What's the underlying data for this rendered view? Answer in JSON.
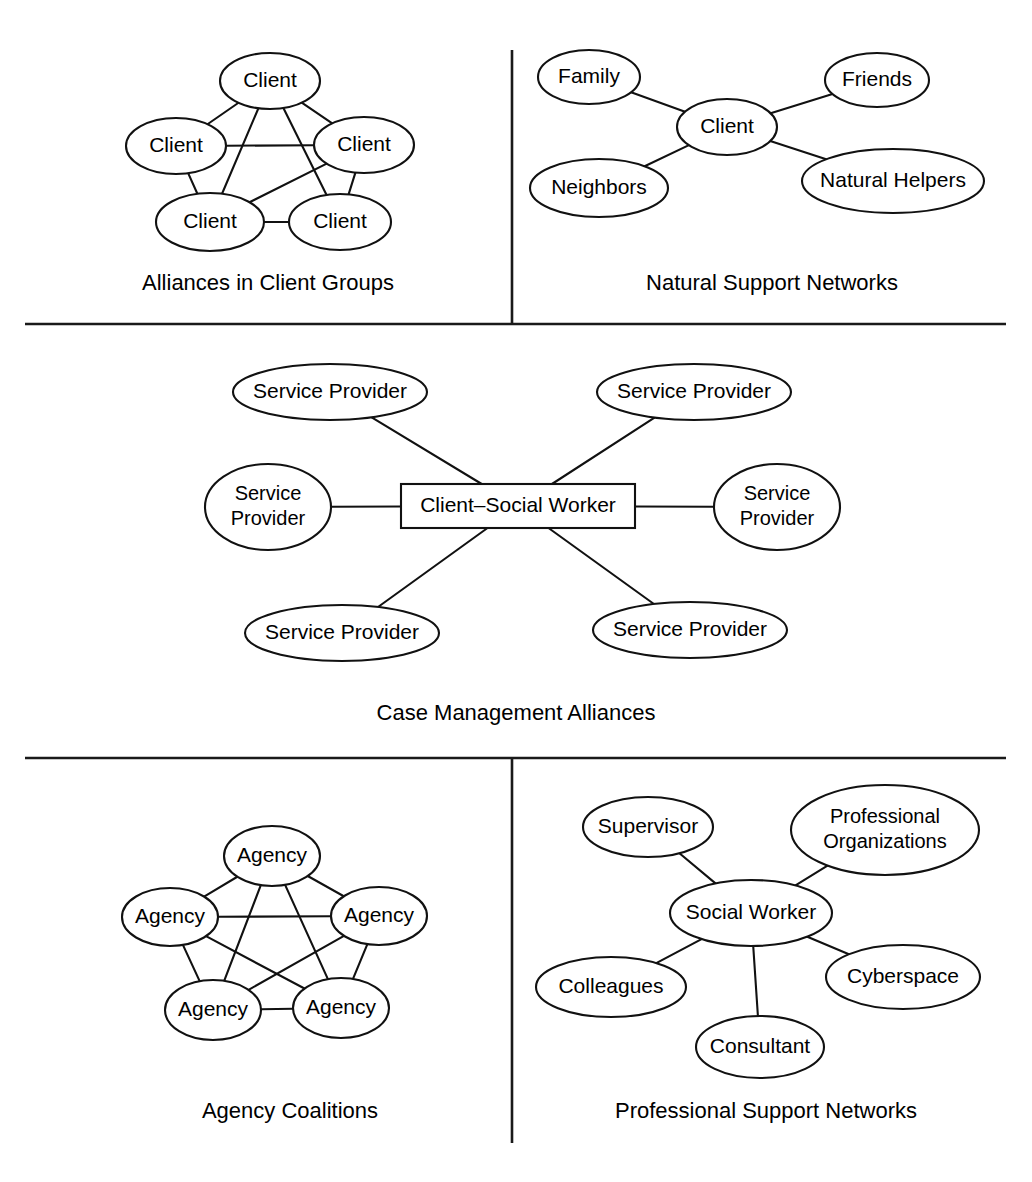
{
  "figure": {
    "background_color": "#ffffff",
    "line_color": "#111111",
    "text_color": "#000000"
  },
  "dividers": [
    {
      "name": "vertical-divider-top",
      "x1": 512,
      "y1": 50,
      "x2": 512,
      "y2": 324
    },
    {
      "name": "horizontal-divider-upper",
      "x1": 25,
      "y1": 324,
      "x2": 1006,
      "y2": 324
    },
    {
      "name": "horizontal-divider-lower",
      "x1": 25,
      "y1": 758,
      "x2": 1006,
      "y2": 758
    },
    {
      "name": "vertical-divider-bottom",
      "x1": 512,
      "y1": 758,
      "x2": 512,
      "y2": 1143
    }
  ],
  "panels": [
    {
      "id": "alliances-in-client-groups",
      "caption": "Alliances in Client Groups",
      "caption_x": 268,
      "caption_y": 284,
      "graph_type": "near-complete-graph",
      "nodes": [
        {
          "id": "c-top",
          "label": "Client",
          "cx": 270,
          "cy": 81,
          "rx": 50,
          "ry": 28,
          "shape": "ellipse"
        },
        {
          "id": "c-left",
          "label": "Client",
          "cx": 176,
          "cy": 146,
          "rx": 50,
          "ry": 28,
          "shape": "ellipse"
        },
        {
          "id": "c-right",
          "label": "Client",
          "cx": 364,
          "cy": 145,
          "rx": 50,
          "ry": 28,
          "shape": "ellipse"
        },
        {
          "id": "c-bleft",
          "label": "Client",
          "cx": 210,
          "cy": 222,
          "rx": 54,
          "ry": 29,
          "shape": "ellipse"
        },
        {
          "id": "c-bright",
          "label": "Client",
          "cx": 340,
          "cy": 222,
          "rx": 51,
          "ry": 28,
          "shape": "ellipse"
        }
      ],
      "edges": [
        [
          "c-top",
          "c-left"
        ],
        [
          "c-top",
          "c-right"
        ],
        [
          "c-top",
          "c-bleft"
        ],
        [
          "c-top",
          "c-bright"
        ],
        [
          "c-left",
          "c-right"
        ],
        [
          "c-left",
          "c-bleft"
        ],
        [
          "c-right",
          "c-bleft"
        ],
        [
          "c-right",
          "c-bright"
        ],
        [
          "c-bleft",
          "c-bright"
        ]
      ]
    },
    {
      "id": "natural-support-networks",
      "caption": "Natural Support Networks",
      "caption_x": 772,
      "caption_y": 284,
      "graph_type": "star",
      "nodes": [
        {
          "id": "n-client",
          "label": "Client",
          "cx": 727,
          "cy": 127,
          "rx": 50,
          "ry": 28,
          "shape": "ellipse"
        },
        {
          "id": "n-family",
          "label": "Family",
          "cx": 589,
          "cy": 77,
          "rx": 51,
          "ry": 27,
          "shape": "ellipse"
        },
        {
          "id": "n-friends",
          "label": "Friends",
          "cx": 877,
          "cy": 80,
          "rx": 52,
          "ry": 27,
          "shape": "ellipse"
        },
        {
          "id": "n-neighbors",
          "label": "Neighbors",
          "cx": 599,
          "cy": 188,
          "rx": 69,
          "ry": 29,
          "shape": "ellipse"
        },
        {
          "id": "n-helpers",
          "label": "Natural Helpers",
          "cx": 893,
          "cy": 181,
          "rx": 91,
          "ry": 32,
          "shape": "ellipse"
        }
      ],
      "edges": [
        [
          "n-client",
          "n-family"
        ],
        [
          "n-client",
          "n-friends"
        ],
        [
          "n-client",
          "n-neighbors"
        ],
        [
          "n-client",
          "n-helpers"
        ]
      ]
    },
    {
      "id": "case-management-alliances",
      "caption": "Case Management Alliances",
      "caption_x": 516,
      "caption_y": 714,
      "graph_type": "hub-and-spoke",
      "nodes": [
        {
          "id": "cm-hub",
          "label": "Client–Social Worker",
          "cx": 518,
          "cy": 506,
          "rx": 117,
          "ry": 22,
          "shape": "rect"
        },
        {
          "id": "cm-tl",
          "label": "Service Provider",
          "cx": 330,
          "cy": 392,
          "rx": 97,
          "ry": 28,
          "shape": "ellipse"
        },
        {
          "id": "cm-tr",
          "label": "Service Provider",
          "cx": 694,
          "cy": 392,
          "rx": 97,
          "ry": 28,
          "shape": "ellipse"
        },
        {
          "id": "cm-l",
          "label": "Service\nProvider",
          "cx": 268,
          "cy": 507,
          "rx": 63,
          "ry": 43,
          "shape": "ellipse"
        },
        {
          "id": "cm-r",
          "label": "Service\nProvider",
          "cx": 777,
          "cy": 507,
          "rx": 63,
          "ry": 43,
          "shape": "ellipse"
        },
        {
          "id": "cm-bl",
          "label": "Service Provider",
          "cx": 342,
          "cy": 633,
          "rx": 97,
          "ry": 28,
          "shape": "ellipse"
        },
        {
          "id": "cm-br",
          "label": "Service Provider",
          "cx": 690,
          "cy": 630,
          "rx": 97,
          "ry": 28,
          "shape": "ellipse"
        }
      ],
      "edges": [
        [
          "cm-hub",
          "cm-tl"
        ],
        [
          "cm-hub",
          "cm-tr"
        ],
        [
          "cm-hub",
          "cm-l"
        ],
        [
          "cm-hub",
          "cm-r"
        ],
        [
          "cm-hub",
          "cm-bl"
        ],
        [
          "cm-hub",
          "cm-br"
        ]
      ]
    },
    {
      "id": "agency-coalitions",
      "caption": "Agency Coalitions",
      "caption_x": 290,
      "caption_y": 1112,
      "graph_type": "complete-graph",
      "nodes": [
        {
          "id": "a-top",
          "label": "Agency",
          "cx": 272,
          "cy": 856,
          "rx": 48,
          "ry": 30,
          "shape": "ellipse"
        },
        {
          "id": "a-left",
          "label": "Agency",
          "cx": 170,
          "cy": 917,
          "rx": 48,
          "ry": 29,
          "shape": "ellipse"
        },
        {
          "id": "a-right",
          "label": "Agency",
          "cx": 379,
          "cy": 916,
          "rx": 48,
          "ry": 29,
          "shape": "ellipse"
        },
        {
          "id": "a-bleft",
          "label": "Agency",
          "cx": 213,
          "cy": 1010,
          "rx": 48,
          "ry": 30,
          "shape": "ellipse"
        },
        {
          "id": "a-bright",
          "label": "Agency",
          "cx": 341,
          "cy": 1008,
          "rx": 48,
          "ry": 30,
          "shape": "ellipse"
        }
      ],
      "edges": [
        [
          "a-top",
          "a-left"
        ],
        [
          "a-top",
          "a-right"
        ],
        [
          "a-top",
          "a-bleft"
        ],
        [
          "a-top",
          "a-bright"
        ],
        [
          "a-left",
          "a-right"
        ],
        [
          "a-left",
          "a-bleft"
        ],
        [
          "a-left",
          "a-bright"
        ],
        [
          "a-right",
          "a-bleft"
        ],
        [
          "a-right",
          "a-bright"
        ],
        [
          "a-bleft",
          "a-bright"
        ]
      ]
    },
    {
      "id": "professional-support-networks",
      "caption": "Professional Support Networks",
      "caption_x": 766,
      "caption_y": 1112,
      "graph_type": "star",
      "nodes": [
        {
          "id": "p-sw",
          "label": "Social Worker",
          "cx": 751,
          "cy": 913,
          "rx": 81,
          "ry": 33,
          "shape": "ellipse"
        },
        {
          "id": "p-super",
          "label": "Supervisor",
          "cx": 648,
          "cy": 827,
          "rx": 65,
          "ry": 30,
          "shape": "ellipse"
        },
        {
          "id": "p-orgs",
          "label": "Professional\nOrganizations",
          "cx": 885,
          "cy": 830,
          "rx": 94,
          "ry": 45,
          "shape": "ellipse"
        },
        {
          "id": "p-coll",
          "label": "Colleagues",
          "cx": 611,
          "cy": 987,
          "rx": 75,
          "ry": 30,
          "shape": "ellipse"
        },
        {
          "id": "p-cons",
          "label": "Consultant",
          "cx": 760,
          "cy": 1047,
          "rx": 64,
          "ry": 31,
          "shape": "ellipse"
        },
        {
          "id": "p-cyber",
          "label": "Cyberspace",
          "cx": 903,
          "cy": 977,
          "rx": 77,
          "ry": 32,
          "shape": "ellipse"
        }
      ],
      "edges": [
        [
          "p-sw",
          "p-super"
        ],
        [
          "p-sw",
          "p-orgs"
        ],
        [
          "p-sw",
          "p-coll"
        ],
        [
          "p-sw",
          "p-cons"
        ],
        [
          "p-sw",
          "p-cyber"
        ]
      ]
    }
  ]
}
